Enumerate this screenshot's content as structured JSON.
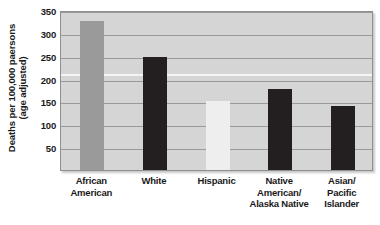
{
  "chart_data": {
    "type": "bar",
    "title": "",
    "xlabel": "",
    "ylabel_line1": "Deaths per 100,000 paersons",
    "ylabel_line2": "(age adjusted)",
    "categories": [
      "African American",
      "White",
      "Hispanic",
      "Native American/ Alaska Native",
      "Asian/ Pacific Islander"
    ],
    "category_lines": [
      [
        "African",
        "American"
      ],
      [
        "White"
      ],
      [
        "Hispanic"
      ],
      [
        "Native",
        "American/",
        "Alaska Native"
      ],
      [
        "Asian/",
        "Pacific",
        "Islander"
      ]
    ],
    "values": [
      325,
      247,
      150,
      177,
      140
    ],
    "bar_colors": [
      "#9a9a9a",
      "#231f20",
      "#eeeeee",
      "#231f20",
      "#231f20"
    ],
    "ylim": [
      0,
      350
    ],
    "yticks": [
      350,
      300,
      250,
      200,
      150,
      100,
      50
    ],
    "ytick_labels": [
      "350",
      "300",
      "250",
      "200",
      "150",
      "100",
      "50"
    ],
    "grid": true,
    "highlight_gridline": 215,
    "legend": "none",
    "plot_background": "#d5d5d5",
    "gridline_color": "#9a9a9a",
    "frame_color": "#8f8f8f"
  }
}
